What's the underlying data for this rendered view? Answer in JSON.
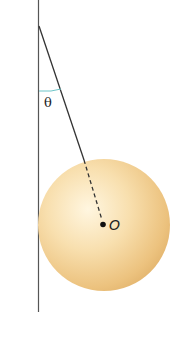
{
  "diagram": {
    "labels": {
      "angle": "θ",
      "center": "O"
    },
    "colors": {
      "wall": "#555555",
      "string": "#3a3a3a",
      "angle_arc": "#6fc6c9",
      "sphere_light": "#fff3d6",
      "sphere_mid": "#f6d9a0",
      "sphere_dark": "#d9a860",
      "center_dot": "#111111"
    }
  }
}
